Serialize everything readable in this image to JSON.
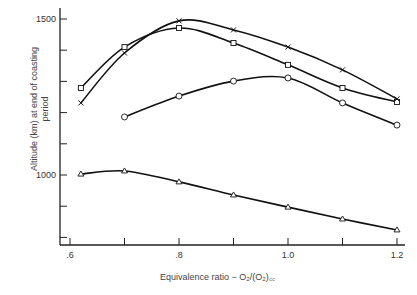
{
  "chart_data": {
    "type": "line",
    "title": "",
    "xlabel": "Equivalence ratio − O2/(O2)cc",
    "ylabel": "Altitude (km) at end of coasting period",
    "xlim": [
      0.6,
      1.2
    ],
    "ylim": [
      700,
      1570
    ],
    "x_ticks": [
      0.6,
      0.7,
      0.8,
      0.9,
      1.0,
      1.1,
      1.2
    ],
    "x_tick_labels": [
      ".6",
      "",
      ".8",
      "",
      "1.0",
      "",
      "1.2"
    ],
    "y_ticks": [
      800,
      900,
      1000,
      1100,
      1200,
      1300,
      1400,
      1500
    ],
    "y_tick_labels": [
      "",
      "",
      "1000",
      "",
      "",
      "",
      "",
      "1500"
    ],
    "grid": false,
    "legend": "none",
    "series": [
      {
        "name": "square",
        "marker": "square",
        "x": [
          0.62,
          0.7,
          0.8,
          0.9,
          1.0,
          1.1,
          1.2
        ],
        "values": [
          1279,
          1410,
          1471,
          1423,
          1353,
          1279,
          1234
        ]
      },
      {
        "name": "cross",
        "marker": "x",
        "x": [
          0.62,
          0.7,
          0.8,
          0.9,
          1.0,
          1.1,
          1.2
        ],
        "values": [
          1231,
          1391,
          1494,
          1465,
          1410,
          1337,
          1244
        ]
      },
      {
        "name": "circle",
        "marker": "circle",
        "x": [
          0.7,
          0.8,
          0.9,
          1.0,
          1.1,
          1.2
        ],
        "values": [
          1186,
          1253,
          1301,
          1311,
          1231,
          1160
        ]
      },
      {
        "name": "triangle",
        "marker": "triangle",
        "x": [
          0.62,
          0.7,
          0.8,
          0.9,
          1.0,
          1.1,
          1.2
        ],
        "values": [
          1003,
          1013,
          978,
          936,
          897,
          859,
          824
        ]
      }
    ]
  },
  "labels": {
    "ylabel_line1": "Altitude (km) at end of coasting",
    "ylabel_line2": "period",
    "xlabel": "Equivalence ratio − O₂/(O₂)꜀꜀"
  }
}
